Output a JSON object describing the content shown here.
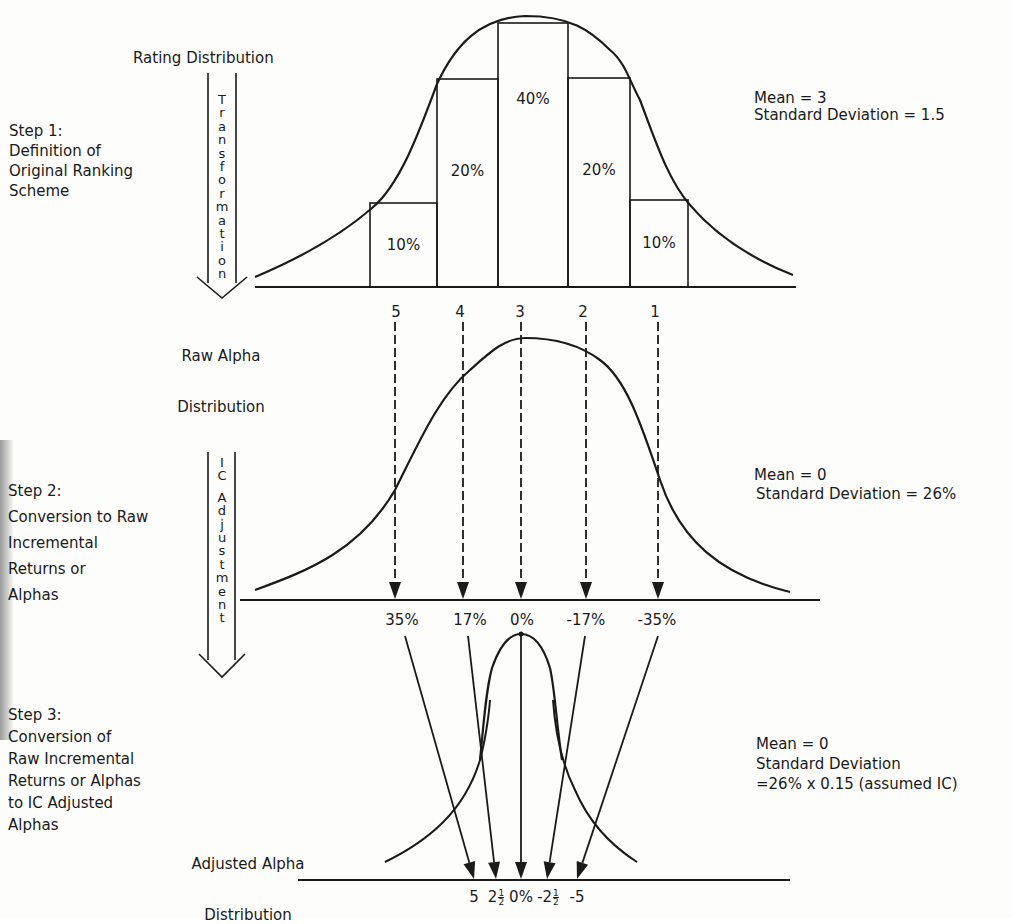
{
  "figure": {
    "step1": {
      "label_lines": [
        "Step 1:",
        "Definition of",
        "Original Ranking",
        "Scheme"
      ],
      "dist_title": "Rating Distribution",
      "stats": [
        "Mean = 3",
        "Standard Deviation = 1.5"
      ],
      "transform_arrow_text": "Transformation",
      "bars": [
        {
          "rating": 5,
          "label": "10%",
          "share": 10
        },
        {
          "rating": 4,
          "label": "20%",
          "share": 20
        },
        {
          "rating": 3,
          "label": "40%",
          "share": 40
        },
        {
          "rating": 2,
          "label": "20%",
          "share": 20
        },
        {
          "rating": 1,
          "label": "10%",
          "share": 10
        }
      ]
    },
    "step2": {
      "label_lines": [
        "Step 2:",
        "Conversion to Raw",
        "Incremental",
        "Returns or",
        "Alphas"
      ],
      "dist_title_lines": [
        "Raw Alpha",
        "Distribution"
      ],
      "stats": [
        "Mean = 0",
        "Standard Deviation = 26%"
      ],
      "adjust_arrow_text": "IC Adjustment",
      "rating_labels": [
        "5",
        "4",
        "3",
        "2",
        "1"
      ],
      "alpha_labels": [
        "35%",
        "17%",
        "0%",
        "-17%",
        "-35%"
      ]
    },
    "step3": {
      "label_lines": [
        "Step 3:",
        "Conversion of",
        "Raw Incremental",
        "Returns or Alphas",
        "to IC Adjusted",
        "Alphas"
      ],
      "dist_title_lines": [
        "Adjusted Alpha",
        "Distribution"
      ],
      "stats": [
        "Mean = 0",
        "Standard Deviation",
        "=26% x 0.15 (assumed IC)"
      ],
      "adjusted_labels": [
        {
          "whole": "5",
          "num": "",
          "den": ""
        },
        {
          "whole": "2",
          "num": "1",
          "den": "2"
        },
        {
          "whole": "0%",
          "num": "",
          "den": ""
        },
        {
          "whole": "-2",
          "num": "1",
          "den": "2"
        },
        {
          "whole": "-5",
          "num": "",
          "den": ""
        }
      ]
    }
  },
  "chart_data": {
    "type": "diagram",
    "stages": [
      {
        "name": "Rating Distribution",
        "type": "bar",
        "categories": [
          "5",
          "4",
          "3",
          "2",
          "1"
        ],
        "values": [
          10,
          20,
          40,
          20,
          10
        ],
        "unit": "%",
        "mean": 3,
        "std_dev": 1.5
      },
      {
        "name": "Raw Alpha Distribution",
        "type": "mapping",
        "ratings": [
          5,
          4,
          3,
          2,
          1
        ],
        "alphas_pct": [
          35,
          17,
          0,
          -17,
          -35
        ],
        "mean": 0,
        "std_dev_pct": 26
      },
      {
        "name": "Adjusted Alpha Distribution",
        "type": "mapping",
        "raw_alphas_pct": [
          35,
          17,
          0,
          -17,
          -35
        ],
        "adjusted_alphas": [
          5,
          2.5,
          0,
          -2.5,
          -5
        ],
        "mean": 0,
        "std_dev_expr": "26% x 0.15",
        "assumed_ic": 0.15
      }
    ]
  }
}
